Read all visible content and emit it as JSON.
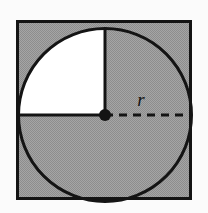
{
  "figure": {
    "name": "circle-inscribed-in-square",
    "background_color": "#fbfbfb",
    "shaded_color": "#9a9a9a",
    "unshaded_color": "#ffffff",
    "stroke_color": "#141414",
    "labels": {
      "radius": "r"
    },
    "square": {
      "x": 16,
      "y": 20,
      "width": 176,
      "height": 180,
      "stroke_width": 3
    },
    "circle": {
      "center_x": 105,
      "center_y": 115,
      "radius": 87,
      "stroke_width": 3
    },
    "radius_lines": {
      "vertical_up": {
        "x1": 105,
        "y1": 115,
        "x2": 105,
        "y2": 28,
        "style": "solid"
      },
      "horizontal_left": {
        "x1": 105,
        "y1": 115,
        "x2": 18,
        "y2": 115,
        "style": "solid"
      },
      "horizontal_right": {
        "x1": 105,
        "y1": 115,
        "x2": 192,
        "y2": 115,
        "style": "dashed"
      }
    },
    "center_dot": {
      "cx": 105,
      "cy": 115,
      "r": 6
    },
    "radius_label_position": {
      "x": 141,
      "y": 105
    }
  }
}
